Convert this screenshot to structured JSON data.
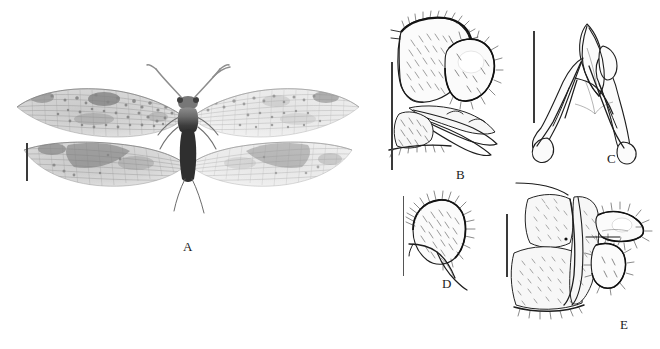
{
  "figure": {
    "type": "taxonomic-plate",
    "background_color": "#ffffff",
    "ink_color": "#1d1d1d",
    "panel_count": 5
  },
  "panels": [
    {
      "id": "A",
      "label": "A",
      "kind": "habitus-photograph",
      "subject": "adult dobsonfly, dorsal habitus, wings spread",
      "label_x": 183,
      "label_y": 240,
      "scalebar": {
        "x": 26,
        "y": 143,
        "height": 38,
        "orientation": "vertical"
      }
    },
    {
      "id": "B",
      "label": "B",
      "kind": "line-drawing",
      "subject": "male terminalia, lateral view",
      "label_x": 456,
      "label_y": 168,
      "scalebar": {
        "x": 391,
        "y": 62,
        "height": 108,
        "orientation": "vertical"
      }
    },
    {
      "id": "C",
      "label": "C",
      "kind": "line-drawing",
      "subject": "gonocoxites, ventral view",
      "label_x": 607,
      "label_y": 152,
      "scalebar": {
        "x": 533,
        "y": 31,
        "height": 92,
        "orientation": "vertical"
      }
    },
    {
      "id": "D",
      "label": "D",
      "kind": "line-drawing",
      "subject": "setose lobe, lateral view",
      "label_x": 442,
      "label_y": 277,
      "scalebar": {
        "x": 403,
        "y": 196,
        "height": 80,
        "orientation": "vertical"
      }
    },
    {
      "id": "E",
      "label": "E",
      "kind": "line-drawing",
      "subject": "abdominal apex with genital segments, lateral view",
      "label_x": 620,
      "label_y": 325,
      "scalebar": {
        "x": 506,
        "y": 214,
        "height": 63,
        "orientation": "vertical"
      }
    }
  ]
}
